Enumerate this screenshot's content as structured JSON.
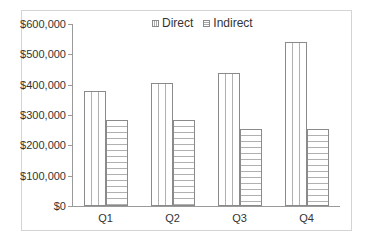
{
  "chart_data": {
    "type": "bar",
    "title": "",
    "xlabel": "",
    "ylabel": "",
    "categories": [
      "Q1",
      "Q2",
      "Q3",
      "Q4"
    ],
    "series": [
      {
        "name": "Direct",
        "values": [
          380000,
          405000,
          440000,
          540000
        ],
        "pattern": "vertical-lines"
      },
      {
        "name": "Indirect",
        "values": [
          285000,
          285000,
          255000,
          255000
        ],
        "pattern": "horizontal-lines"
      }
    ],
    "ylim": [
      0,
      600000
    ],
    "yticks": [
      0,
      100000,
      200000,
      300000,
      400000,
      500000,
      600000
    ],
    "ytick_labels": [
      "$0",
      "$100,000",
      "$200,000",
      "$300,000",
      "$400,000",
      "$500,000",
      "$600,000"
    ],
    "grid": false,
    "legend_position": "top-center"
  },
  "legend": {
    "items": [
      {
        "label": "Direct"
      },
      {
        "label": "Indirect"
      }
    ]
  },
  "colors": {
    "axis": "#9a9a9a",
    "bar_border": "#8a8a8a",
    "pattern": "#b0b0b0",
    "text": "#333333"
  }
}
